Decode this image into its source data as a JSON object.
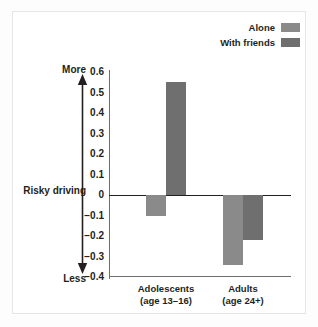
{
  "chart_data": {
    "type": "bar",
    "title": "",
    "subtitle": "",
    "xlabel": "",
    "ylabel": "Risky driving",
    "ylim": [
      -0.4,
      0.6
    ],
    "grid": false,
    "legend_position": "top-right",
    "categories": [
      "Adolescents (age 13–16)",
      "Adults (age 24+)"
    ],
    "category_lines": [
      {
        "line1": "Adolescents",
        "line2": "(age 13–16)"
      },
      {
        "line1": "Adults",
        "line2": "(age 24+)"
      }
    ],
    "series": [
      {
        "name": "Alone",
        "color": "#8a8a8a",
        "values": [
          -0.1,
          -0.34
        ]
      },
      {
        "name": "With friends",
        "color": "#6f6f6f",
        "values": [
          0.55,
          -0.22
        ]
      }
    ],
    "yticks": [
      {
        "value": 0.6,
        "label": "0.6"
      },
      {
        "value": 0.5,
        "label": "0.5"
      },
      {
        "value": 0.4,
        "label": "0.4"
      },
      {
        "value": 0.3,
        "label": "0.3"
      },
      {
        "value": 0.2,
        "label": "0.2"
      },
      {
        "value": 0.1,
        "label": "0.1"
      },
      {
        "value": 0.0,
        "label": "0"
      },
      {
        "value": -0.1,
        "label": "−0.1"
      },
      {
        "value": -0.2,
        "label": "−0.2"
      },
      {
        "value": -0.3,
        "label": "−0.3"
      },
      {
        "value": -0.4,
        "label": "−0.4"
      }
    ],
    "annotations": {
      "axis_arrow_top_label": "More",
      "axis_arrow_middle_label": "Risky driving",
      "axis_arrow_bottom_label": "Less",
      "arrow_icon": "double-headed-vertical-arrow"
    }
  },
  "legend": {
    "entries": [
      {
        "label": "Alone",
        "color": "#8a8a8a"
      },
      {
        "label": "With friends",
        "color": "#6f6f6f"
      }
    ]
  },
  "colors": {
    "background": "#ffffff",
    "frame": "#e6e6e6",
    "axis": "#6d6e71",
    "zero_line": "#231f20",
    "text": "#231f20",
    "series_alone": "#8a8a8a",
    "series_with_friends": "#6f6f6f"
  }
}
